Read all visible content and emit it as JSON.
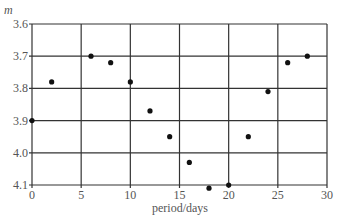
{
  "chart_data": {
    "type": "scatter",
    "title": "",
    "xlabel": "period/days",
    "ylabel": "m",
    "xlim": [
      0,
      30
    ],
    "ylim": [
      3.6,
      4.1
    ],
    "y_inverted": true,
    "grid": true,
    "legend": null,
    "x_ticks": [
      "0",
      "5",
      "10",
      "15",
      "20",
      "25",
      "30"
    ],
    "y_ticks": [
      "3.6",
      "3.7",
      "3.8",
      "3.9",
      "4.0",
      "4.1"
    ],
    "series": [
      {
        "name": "magnitude",
        "x": [
          0,
          2,
          6,
          8,
          10,
          12,
          14,
          16,
          18,
          20,
          22,
          24,
          26,
          28
        ],
        "y": [
          3.9,
          3.78,
          3.7,
          3.72,
          3.78,
          3.87,
          3.95,
          4.03,
          4.11,
          4.1,
          3.95,
          3.81,
          3.72,
          3.7
        ]
      }
    ]
  },
  "colors": {
    "grid": "#333333",
    "point": "#111111",
    "text": "#555555"
  }
}
